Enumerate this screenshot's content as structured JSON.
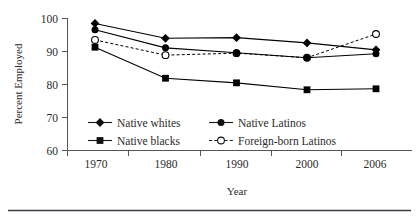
{
  "chart_data": {
    "type": "line",
    "title": "",
    "xlabel": "Year",
    "ylabel": "Percent Employed",
    "categories": [
      "1970",
      "1980",
      "1990",
      "2000",
      "2006"
    ],
    "x": [
      1970,
      1980,
      1990,
      2000,
      2006
    ],
    "ylim": [
      60,
      100
    ],
    "yticks": [
      60,
      70,
      80,
      90,
      100
    ],
    "ytick_labels": [
      "60",
      "70",
      "80",
      "90",
      "100"
    ],
    "xtick_labels": [
      "1970",
      "1980",
      "1990",
      "2000",
      "2006"
    ],
    "grid": false,
    "legend_position": "inside-bottom-left",
    "series": [
      {
        "name": "Native whites",
        "marker": "filled-diamond",
        "line_style": "solid",
        "color": "#000000",
        "values": [
          98.5,
          94.0,
          94.2,
          92.6,
          90.5
        ]
      },
      {
        "name": "Native Latinos",
        "marker": "filled-circle",
        "line_style": "solid",
        "color": "#000000",
        "values": [
          96.6,
          91.1,
          89.6,
          88.1,
          89.3
        ]
      },
      {
        "name": "Native blacks",
        "marker": "filled-square",
        "line_style": "solid",
        "color": "#000000",
        "values": [
          91.3,
          81.9,
          80.5,
          78.4,
          78.7
        ]
      },
      {
        "name": "Foreign-born Latinos",
        "marker": "open-circle",
        "line_style": "dashed",
        "color": "#000000",
        "values": [
          93.5,
          88.9,
          89.5,
          88.1,
          95.3
        ]
      }
    ]
  },
  "axes": {
    "y_title": "Percent Employed",
    "x_title": "Year"
  },
  "legend": {
    "entries": [
      {
        "label": "Native whites"
      },
      {
        "label": "Native Latinos"
      },
      {
        "label": "Native blacks"
      },
      {
        "label": "Foreign-born Latinos"
      }
    ]
  }
}
